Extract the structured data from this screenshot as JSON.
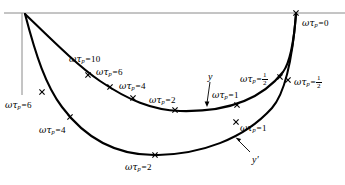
{
  "figure": {
    "kind": "polar-response-plot",
    "background_color": "#ffffff",
    "curve_color": "#000000",
    "axis_color": "#8a8a8a",
    "marker_glyph": "x"
  },
  "axes": {
    "horizontal_axis": {
      "name": "real-axis",
      "y": 13,
      "x_start": 4,
      "x_end": 345
    },
    "vertical_axis": {
      "name": "imaginary-axis",
      "x": 22,
      "y_start": 13,
      "y_end": 95
    }
  },
  "curves": [
    {
      "id": "y",
      "label": "y",
      "label_position": {
        "x": 208,
        "y": 72
      },
      "arrow_from": {
        "x": 210,
        "y": 82
      },
      "arrow_to": {
        "x": 207,
        "y": 105
      }
    },
    {
      "id": "yprime",
      "label": "y′",
      "label_position": {
        "x": 252,
        "y": 155
      },
      "arrow_from": {
        "x": 250,
        "y": 152
      },
      "arrow_to": {
        "x": 236,
        "y": 138
      }
    }
  ],
  "markers": [
    {
      "id": "m-top-right",
      "curve": "shared",
      "x": 296,
      "y": 13,
      "label": "ωτ",
      "sub": "p",
      "eq": "=",
      "value": "0",
      "label_x": 302,
      "label_y": 19,
      "fraction": null
    },
    {
      "id": "m-y-10",
      "curve": "y",
      "x": 88,
      "y": 75,
      "label": "ωτ",
      "sub": "p",
      "eq": "=",
      "value": "10",
      "label_x": 69,
      "label_y": 55,
      "fraction": null
    },
    {
      "id": "m-y-6",
      "curve": "y",
      "x": 110,
      "y": 87,
      "label": "ωτ",
      "sub": "p",
      "eq": "=",
      "value": "6",
      "label_x": 96,
      "label_y": 68,
      "fraction": null
    },
    {
      "id": "m-y-4",
      "curve": "y",
      "x": 133,
      "y": 98,
      "label": "ωτ",
      "sub": "p",
      "eq": "=",
      "value": "4",
      "label_x": 119,
      "label_y": 82,
      "fraction": null
    },
    {
      "id": "m-y-2",
      "curve": "y",
      "x": 175,
      "y": 110,
      "label": "ωτ",
      "sub": "p",
      "eq": "=",
      "value": "2",
      "label_x": 149,
      "label_y": 96,
      "fraction": null
    },
    {
      "id": "m-y-1",
      "curve": "y",
      "x": 237,
      "y": 105,
      "label": "ωτ",
      "sub": "p",
      "eq": "=",
      "value": "1",
      "label_x": 212,
      "label_y": 91,
      "fraction": null
    },
    {
      "id": "m-y-half",
      "curve": "y",
      "x": 280,
      "y": 77,
      "label": "ωτ",
      "sub": "p",
      "eq": "=",
      "value": null,
      "label_x": 240,
      "label_y": 72,
      "fraction": {
        "n": "1",
        "d": "2"
      }
    },
    {
      "id": "m-yp-half",
      "curve": "yprime",
      "x": 288,
      "y": 80,
      "label": "ωτ",
      "sub": "p",
      "eq": "=",
      "value": null,
      "label_x": 294,
      "label_y": 75,
      "fraction": {
        "n": "1",
        "d": "2"
      }
    },
    {
      "id": "m-yp-6",
      "curve": "yprime",
      "x": 42,
      "y": 92,
      "label": "ωτ",
      "sub": "p",
      "eq": "=",
      "value": "6",
      "label_x": 5,
      "label_y": 101,
      "fraction": null
    },
    {
      "id": "m-yp-4",
      "curve": "yprime",
      "x": 70,
      "y": 117,
      "label": "ωτ",
      "sub": "p",
      "eq": "=",
      "value": "4",
      "label_x": 39,
      "label_y": 126,
      "fraction": null
    },
    {
      "id": "m-yp-2",
      "curve": "yprime",
      "x": 155,
      "y": 155,
      "label": "ωτ",
      "sub": "p",
      "eq": "=",
      "value": "2",
      "label_x": 125,
      "label_y": 163,
      "fraction": null
    },
    {
      "id": "m-yp-1",
      "curve": "yprime",
      "x": 236,
      "y": 122,
      "label": "ωτ",
      "sub": "p",
      "eq": "=",
      "value": "1",
      "label_x": 240,
      "label_y": 124,
      "fraction": null
    }
  ],
  "paths": {
    "curve_y": "M 25,14 C 52,40 78,66 100,81 C 128,100 152,110 180,111 C 218,112 258,104 283,72 C 291,61 294,40 296,14",
    "curve_yprime": "M 25,14 C 36,56 46,86 62,107 C 88,142 122,156 158,155 C 200,154 243,140 272,108 C 286,92 293,52 296,14"
  }
}
